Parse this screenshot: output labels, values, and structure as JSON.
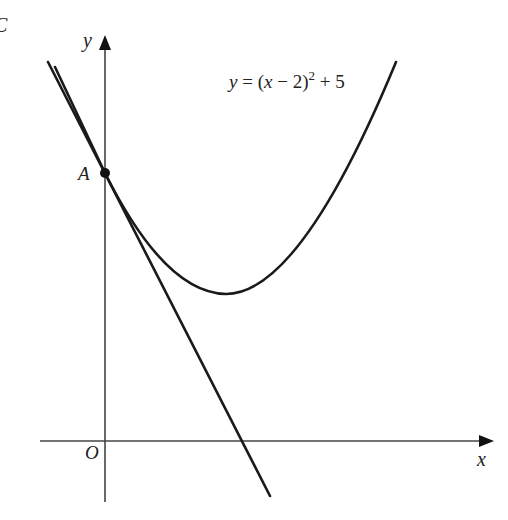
{
  "diagram": {
    "corner_glyph": "C",
    "axes": {
      "x_label": "x",
      "y_label": "y",
      "origin_label": "O"
    },
    "curve": {
      "equation_y": "y",
      "equation_eq": " = (",
      "equation_x": "x",
      "equation_rest": " − 2)",
      "equation_exp": "2",
      "equation_tail": " + 5",
      "vertex": [
        2,
        5
      ]
    },
    "point": {
      "label": "A",
      "coords": [
        0,
        9
      ]
    },
    "tangent": {
      "description": "tangent to curve at A",
      "slope": -4
    },
    "colors": {
      "stroke": "#1a1a1a",
      "axis": "#444444",
      "background": "#ffffff"
    }
  }
}
